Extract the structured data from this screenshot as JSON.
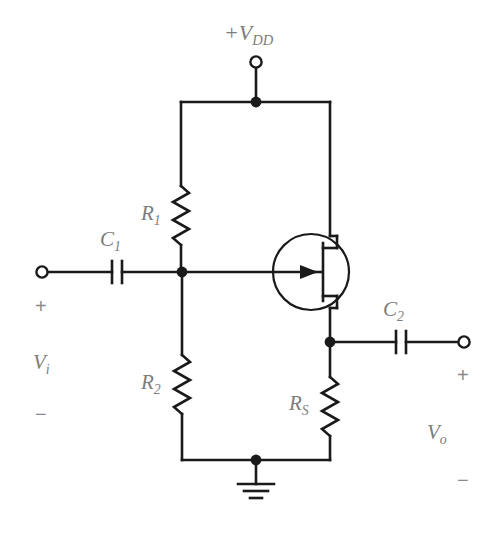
{
  "figure": {
    "kind": "circuit-schematic",
    "width": 496,
    "height": 541,
    "background_color": "#ffffff",
    "wire_color": "#1a1a1a",
    "label_color": "#7d7d7d"
  },
  "labels": {
    "supply": {
      "prefix": "+",
      "symbol": "V",
      "subscript": "DD"
    },
    "c1": {
      "symbol": "C",
      "subscript": "1"
    },
    "c2": {
      "symbol": "C",
      "subscript": "2"
    },
    "r1": {
      "symbol": "R",
      "subscript": "1"
    },
    "r2": {
      "symbol": "R",
      "subscript": "2"
    },
    "rs": {
      "symbol": "R",
      "subscript": "S"
    },
    "vi": {
      "symbol": "V",
      "subscript": "i"
    },
    "vo": {
      "symbol": "V",
      "subscript": "o"
    },
    "input_plus": "+",
    "input_minus": "−",
    "output_plus": "+",
    "output_minus": "−"
  },
  "components": [
    {
      "id": "R1",
      "type": "resistor",
      "label": "R1",
      "orientation": "vertical"
    },
    {
      "id": "R2",
      "type": "resistor",
      "label": "R2",
      "orientation": "vertical"
    },
    {
      "id": "RS",
      "type": "resistor",
      "label": "RS",
      "orientation": "vertical"
    },
    {
      "id": "C1",
      "type": "capacitor",
      "label": "C1",
      "orientation": "horizontal"
    },
    {
      "id": "C2",
      "type": "capacitor",
      "label": "C2",
      "orientation": "horizontal"
    },
    {
      "id": "Q1",
      "type": "n-channel-fet",
      "label": "",
      "orientation": "vertical"
    },
    {
      "id": "GND",
      "type": "ground",
      "label": ""
    }
  ],
  "terminals": [
    {
      "id": "VDD",
      "name": "supply-terminal",
      "shape": "open-circle"
    },
    {
      "id": "VIN",
      "name": "input-terminal",
      "shape": "open-circle"
    },
    {
      "id": "VOUT",
      "name": "output-terminal",
      "shape": "open-circle"
    }
  ],
  "nodes": [
    {
      "id": "N_VDD",
      "name": "supply-node"
    },
    {
      "id": "N_GATE",
      "name": "gate-node"
    },
    {
      "id": "N_SOURCE",
      "name": "source-node"
    },
    {
      "id": "N_GND",
      "name": "ground-node"
    }
  ]
}
